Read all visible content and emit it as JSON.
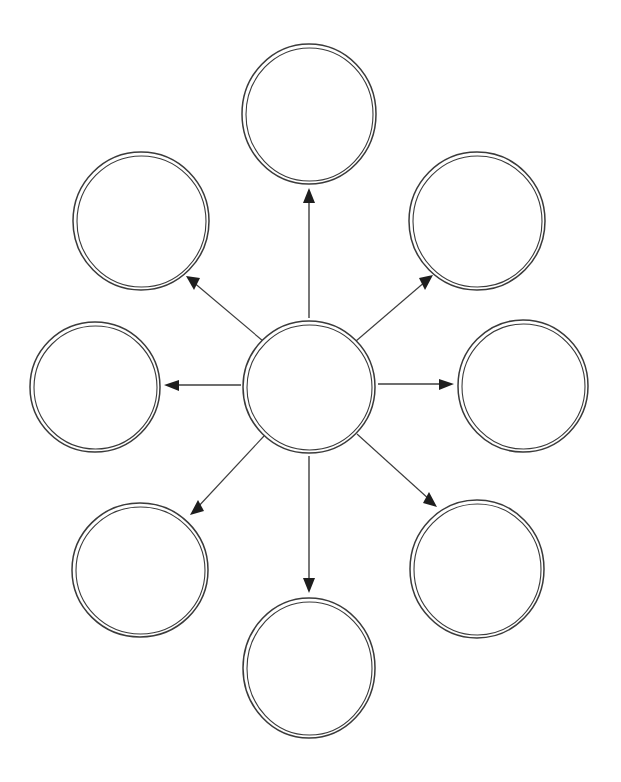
{
  "document": {
    "title": "Bubble Map Graphic Organizer",
    "background_color": "#ffffff",
    "stroke_color": "#3a3a3a",
    "arrow_color": "#1e1e1e",
    "width": 621,
    "height": 782
  },
  "diagram": {
    "type": "bubble-map",
    "style": "hand-drawn double-stroke outline",
    "center": {
      "id": "center-bubble",
      "label": "",
      "cx": 309,
      "cy": 387,
      "rx": 66,
      "ry": 66
    },
    "nodes": [
      {
        "id": "bubble-top",
        "label": "",
        "position": "top",
        "cx": 309,
        "cy": 114,
        "rx": 67,
        "ry": 70
      },
      {
        "id": "bubble-top-left",
        "label": "",
        "position": "top-left",
        "cx": 141,
        "cy": 221,
        "rx": 68,
        "ry": 69
      },
      {
        "id": "bubble-top-right",
        "label": "",
        "position": "top-right",
        "cx": 477,
        "cy": 221,
        "rx": 68,
        "ry": 69
      },
      {
        "id": "bubble-left",
        "label": "",
        "position": "left",
        "cx": 95,
        "cy": 387,
        "rx": 65,
        "ry": 65
      },
      {
        "id": "bubble-right",
        "label": "",
        "position": "right",
        "cx": 523,
        "cy": 386,
        "rx": 65,
        "ry": 66
      },
      {
        "id": "bubble-bottom-left",
        "label": "",
        "position": "bottom-left",
        "cx": 140,
        "cy": 570,
        "rx": 68,
        "ry": 67
      },
      {
        "id": "bubble-bottom-right",
        "label": "",
        "position": "bottom-right",
        "cx": 477,
        "cy": 569,
        "rx": 67,
        "ry": 69
      },
      {
        "id": "bubble-bottom",
        "label": "",
        "position": "bottom",
        "cx": 309,
        "cy": 668,
        "rx": 66,
        "ry": 70
      }
    ],
    "connectors": [
      {
        "id": "arrow-to-top",
        "from": "center-bubble",
        "to": "bubble-top",
        "direction": "up",
        "x1": 309,
        "y1": 318,
        "x2": 309,
        "y2": 190,
        "weight": "normal"
      },
      {
        "id": "arrow-to-top-left",
        "from": "center-bubble",
        "to": "bubble-top-left",
        "direction": "up-left",
        "x1": 263,
        "y1": 341,
        "x2": 186,
        "y2": 276,
        "weight": "thin"
      },
      {
        "id": "arrow-to-top-right",
        "from": "center-bubble",
        "to": "bubble-top-right",
        "direction": "up-right",
        "x1": 356,
        "y1": 341,
        "x2": 432,
        "y2": 276,
        "weight": "thin"
      },
      {
        "id": "arrow-to-left",
        "from": "center-bubble",
        "to": "bubble-left",
        "direction": "left",
        "x1": 241,
        "y1": 385,
        "x2": 165,
        "y2": 385,
        "weight": "normal"
      },
      {
        "id": "arrow-to-right",
        "from": "center-bubble",
        "to": "bubble-right",
        "direction": "right",
        "x1": 378,
        "y1": 384,
        "x2": 453,
        "y2": 384,
        "weight": "normal"
      },
      {
        "id": "arrow-to-bottom-left",
        "from": "center-bubble",
        "to": "bubble-bottom-left",
        "direction": "down-left",
        "x1": 264,
        "y1": 436,
        "x2": 191,
        "y2": 514,
        "weight": "thin"
      },
      {
        "id": "arrow-to-bottom-right",
        "from": "center-bubble",
        "to": "bubble-bottom-right",
        "direction": "down-right",
        "x1": 357,
        "y1": 434,
        "x2": 436,
        "y2": 506,
        "weight": "thin"
      },
      {
        "id": "arrow-to-bottom",
        "from": "center-bubble",
        "to": "bubble-bottom",
        "direction": "down",
        "x1": 309,
        "y1": 456,
        "x2": 309,
        "y2": 592,
        "weight": "normal"
      }
    ]
  }
}
